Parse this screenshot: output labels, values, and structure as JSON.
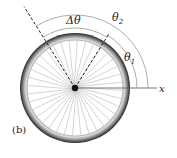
{
  "figure": {
    "panel_label": "(b)",
    "axis_label": "x",
    "labels": {
      "delta_theta": "Δθ",
      "theta1": "θ",
      "theta1_sub": "1",
      "theta2": "θ",
      "theta2_sub": "2"
    },
    "wheel": {
      "center": [
        75,
        88
      ],
      "tire_radius": 54,
      "spoke_count": 36
    },
    "angles_deg": {
      "theta1": 58,
      "theta2": 122
    },
    "colors": {
      "tire": "#2a2a2a",
      "rim": "#bdbdbd",
      "spokes": "#9a9a9a",
      "arcs": "#8a8a8a",
      "axis": "#6a6a6a",
      "dashed": "#222222"
    }
  }
}
